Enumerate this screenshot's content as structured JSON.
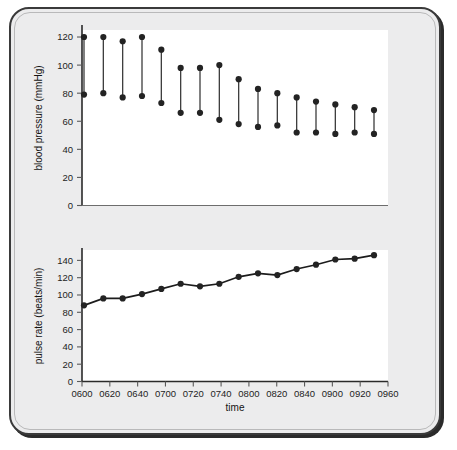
{
  "figure": {
    "xlabel": "time",
    "panels": {
      "bp": {
        "ylabel": "blood pressure (mmHg)"
      },
      "pulse": {
        "ylabel": "pulse rate (beats/min)"
      }
    },
    "colors": {
      "frame": "#3a3a3a",
      "frame_fill": "#ececed",
      "panel": "#ffffff",
      "marker": "#232323",
      "line": "#1c1c1c",
      "axis": "#2a2a2a"
    }
  },
  "chart_data": [
    {
      "type": "bar",
      "title": "",
      "subtitle": "",
      "xlabel": "time",
      "ylabel": "blood pressure (mmHg)",
      "grid": false,
      "legend": "none",
      "orientation": "vertical-range",
      "categories": [
        "0600",
        "0610",
        "0620",
        "0630",
        "0640",
        "0650",
        "0700",
        "0710",
        "0720",
        "0730",
        "0740",
        "0750",
        "0800",
        "0810",
        "0820",
        "0830",
        "0840",
        "0850",
        "0900",
        "0910",
        "0920",
        "0930"
      ],
      "x": [
        600,
        610,
        620,
        630,
        640,
        650,
        700,
        710,
        720,
        730,
        740,
        750,
        800,
        810,
        820,
        830,
        840,
        850,
        900,
        910,
        920,
        930
      ],
      "xtick_labels": [
        "0600",
        "0620",
        "0640",
        "0700",
        "0720",
        "0740",
        "0800",
        "0820",
        "0840",
        "0900",
        "0920",
        "0960"
      ],
      "ytick_labels": [
        "0",
        "20",
        "40",
        "60",
        "80",
        "100",
        "120"
      ],
      "yticks": [
        0,
        20,
        40,
        60,
        80,
        100,
        120
      ],
      "ylim": [
        0,
        125
      ],
      "series": [
        {
          "name": "systolic",
          "values": [
            120,
            120,
            117,
            120,
            111,
            98,
            98,
            100,
            90,
            83,
            80,
            77,
            74,
            72,
            70,
            68
          ]
        },
        {
          "name": "diastolic",
          "values": [
            79,
            80,
            77,
            78,
            73,
            66,
            66,
            61,
            58,
            56,
            57,
            52,
            52,
            51,
            52,
            51
          ]
        }
      ],
      "n_points": 16,
      "annotation": "vertical bars connect systolic (upper dot) to diastolic (lower dot)"
    },
    {
      "type": "line",
      "title": "",
      "subtitle": "",
      "xlabel": "time",
      "ylabel": "pulse rate (beats/min)",
      "grid": false,
      "legend": "none",
      "categories": [
        "0600",
        "0610",
        "0620",
        "0630",
        "0640",
        "0650",
        "0700",
        "0710",
        "0720",
        "0730",
        "0740",
        "0750",
        "0800",
        "0810",
        "0820",
        "0830"
      ],
      "xtick_labels": [
        "0600",
        "0620",
        "0640",
        "0700",
        "0720",
        "0740",
        "0800",
        "0820",
        "0840",
        "0900",
        "0920",
        "0960"
      ],
      "ytick_labels": [
        "0",
        "20",
        "40",
        "60",
        "80",
        "100",
        "120",
        "140"
      ],
      "yticks": [
        0,
        20,
        40,
        60,
        80,
        100,
        120,
        140
      ],
      "ylim": [
        0,
        152
      ],
      "series": [
        {
          "name": "pulse rate",
          "values": [
            88,
            96,
            96,
            101,
            107,
            113,
            110,
            113,
            121,
            125,
            123,
            130,
            135,
            141,
            142,
            146
          ]
        }
      ],
      "n_points": 16
    }
  ]
}
